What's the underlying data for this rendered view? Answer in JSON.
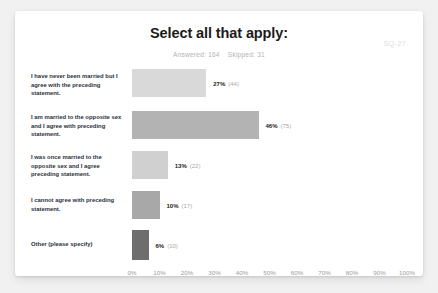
{
  "header": {
    "title": "Select all that apply:",
    "answered_label": "Answered: 164",
    "skipped_label": "Skipped: 31",
    "watermark": "SQ-27"
  },
  "chart_data": {
    "type": "bar",
    "orientation": "horizontal",
    "title": "Select all that apply:",
    "xlabel": "",
    "ylabel": "",
    "xlim": [
      0,
      100
    ],
    "grid": false,
    "legend": "none",
    "answered": 164,
    "skipped": 31,
    "categories": [
      "I have never been married but I agree with the preceding statement.",
      "I am married to the opposite sex and I agree with preceding statement.",
      "I was once married to the opposite sex and I agree preceding statement.",
      "I cannot agree with preceding statement.",
      "Other (please specify)"
    ],
    "values": [
      27,
      46,
      13,
      10,
      6
    ],
    "counts": [
      44,
      75,
      22,
      17,
      10
    ],
    "pct_labels": [
      "27%",
      "46%",
      "13%",
      "10%",
      "6%"
    ],
    "count_labels": [
      "(44)",
      "(75)",
      "(22)",
      "(17)",
      "(10)"
    ],
    "bar_colors": [
      "#d9d9d9",
      "#b3b3b3",
      "#d0d0d0",
      "#a8a8a8",
      "#6e6e6e"
    ],
    "tick_labels": [
      "0%",
      "10%",
      "20%",
      "30%",
      "40%",
      "50%",
      "60%",
      "70%",
      "80%",
      "90%",
      "100%"
    ],
    "tick_values": [
      0,
      10,
      20,
      30,
      40,
      50,
      60,
      70,
      80,
      90,
      100
    ]
  }
}
